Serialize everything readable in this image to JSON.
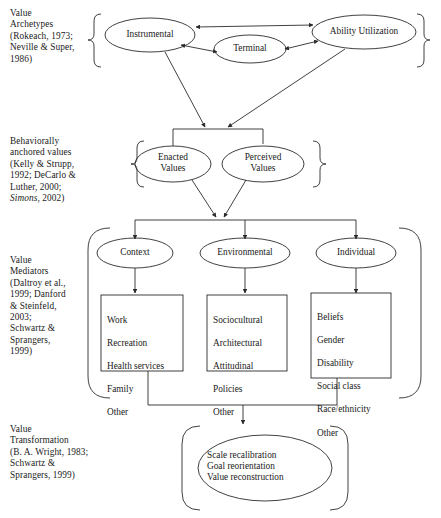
{
  "figure": {
    "type": "flow-diagram"
  },
  "tiers": [
    {
      "id": "value-archetypes",
      "label": "Value\nArchetypes\n(Rokeach, 1973;\nNeville & Super,\n1986)",
      "nodes": [
        {
          "id": "instrumental",
          "label": "Instrumental"
        },
        {
          "id": "terminal",
          "label": "Terminal"
        },
        {
          "id": "ability-utilization",
          "label": "Ability Utilization"
        }
      ]
    },
    {
      "id": "behaviorally-anchored-values",
      "label_parts": {
        "plain": "Behaviorally\nanchored values\n(Kelly & Strupp,\n1992; DeCarlo &\nLuther, 2000;\n",
        "italic": "Simons",
        "tail": ", 2002)"
      },
      "label": "Behaviorally\nanchored values\n(Kelly & Strupp,\n1992; DeCarlo &\nLuther, 2000;\nSimons, 2002)",
      "nodes": [
        {
          "id": "enacted-values",
          "label": "Enacted\nValues"
        },
        {
          "id": "perceived-values",
          "label": "Perceived\nValues"
        }
      ]
    },
    {
      "id": "value-mediators",
      "label": "Value\nMediators\n(Daltroy et al.,\n1999; Danford\n& Steinfeld,\n2003;\nSchwartz &\nSprangers,\n1999)",
      "nodes": [
        {
          "id": "context",
          "label": "Context"
        },
        {
          "id": "environmental",
          "label": "Environmental"
        },
        {
          "id": "individual",
          "label": "Individual"
        }
      ],
      "boxes": [
        {
          "id": "context-box",
          "items": [
            "Work",
            "Recreation",
            "Health services",
            "Family",
            "Other"
          ]
        },
        {
          "id": "environmental-box",
          "items": [
            "Sociocultural",
            "Architectural",
            "Attitudinal",
            "Policies",
            "Other"
          ]
        },
        {
          "id": "individual-box",
          "items": [
            "Beliefs",
            "Gender",
            "Disability",
            "Social class",
            "Race/ethnicity",
            "Other"
          ]
        }
      ]
    },
    {
      "id": "value-transformation",
      "label": "Value\nTransformation\n(B. A. Wright, 1983;\nSchwartz &\nSprangers, 1999)",
      "nodes": [
        {
          "id": "transformation",
          "label": "Scale recalibration\nGoal reorientation\nValue reconstruction"
        }
      ]
    }
  ],
  "colors": {
    "stroke": "#2b2b2b",
    "text": "#1a1a1a",
    "background": "#ffffff"
  }
}
